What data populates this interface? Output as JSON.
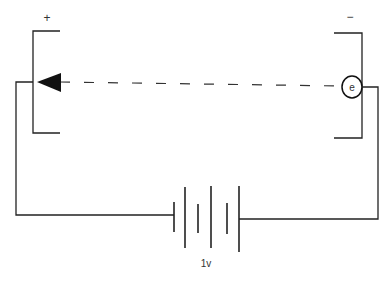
{
  "diagram": {
    "type": "circuit",
    "labels": {
      "positive_plate": "+",
      "negative_plate": "−",
      "electron": "e",
      "battery_voltage": "1v"
    },
    "colors": {
      "stroke": "#222222",
      "background": "#ffffff"
    },
    "components": [
      {
        "name": "positive-plate",
        "label": "+"
      },
      {
        "name": "negative-plate",
        "label": "−"
      },
      {
        "name": "electron",
        "label": "e"
      },
      {
        "name": "battery",
        "label": "1v",
        "cells": 3
      },
      {
        "name": "motion-arrow",
        "direction": "right-to-left"
      }
    ]
  }
}
